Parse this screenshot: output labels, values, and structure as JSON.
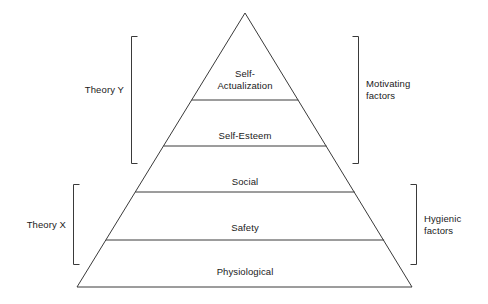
{
  "diagram": {
    "type": "pyramid-hierarchy",
    "stroke_color": "#3a3a3a",
    "text_color": "#1a1a1a",
    "background_color": "#ffffff",
    "tiers": [
      {
        "label": "Self-\nActualization",
        "order": 5
      },
      {
        "label": "Self-Esteem",
        "order": 4
      },
      {
        "label": "Social",
        "order": 3
      },
      {
        "label": "Safety",
        "order": 2
      },
      {
        "label": "Physiological",
        "order": 1
      }
    ],
    "left_brackets": [
      {
        "label": "Theory Y",
        "covers": [
          "Self-Actualization",
          "Self-Esteem"
        ]
      },
      {
        "label": "Theory X",
        "covers": [
          "Social",
          "Safety",
          "Physiological"
        ]
      }
    ],
    "right_brackets": [
      {
        "label": "Motivating\nfactors",
        "covers": [
          "Self-Actualization",
          "Self-Esteem"
        ]
      },
      {
        "label": "Hygienic\nfactors",
        "covers": [
          "Social",
          "Safety",
          "Physiological"
        ]
      }
    ]
  }
}
